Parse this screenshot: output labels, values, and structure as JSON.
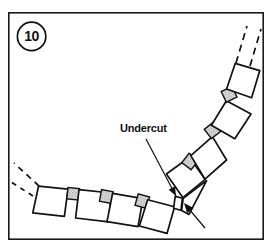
{
  "figure": {
    "number_label": "10",
    "frame": {
      "x": 8,
      "y": 12,
      "width": 256,
      "height": 228,
      "stroke_color": "#1a1a1a"
    },
    "background_color": "#ffffff",
    "line_color": "#111111"
  },
  "callouts": [
    {
      "id": "undercut",
      "label": "Undercut",
      "text_x": 120,
      "text_y": 132,
      "leader_from_x": 146,
      "leader_from_y": 139,
      "leader_to_x": 176,
      "leader_to_y": 196
    }
  ],
  "indicator_arrow": {
    "name": "undercut-arrow",
    "from_x": 205,
    "from_y": 228,
    "to_x": 184,
    "to_y": 203
  },
  "arch": {
    "description": "Segmented arch ring of voussoir blocks separated by small stippled shim blocks",
    "center_x": 58,
    "center_y": 60,
    "inner_radius": 118,
    "outer_radius": 148,
    "start_angle_deg": 14,
    "end_angle_deg": 78,
    "voussoir_count": 8,
    "shim_count": 7,
    "shim_fill_color": "#d8d8d8",
    "voussoir_fill_color": "#ffffff"
  },
  "break_lines": {
    "upper_right": [
      {
        "x1": 236,
        "y1": 63,
        "x2": 247,
        "y2": 26
      },
      {
        "x1": 250,
        "y1": 66,
        "x2": 261,
        "y2": 29
      }
    ],
    "lower_left": [
      {
        "x1": 39,
        "y1": 186,
        "x2": 14,
        "y2": 163
      },
      {
        "x1": 33,
        "y1": 196,
        "x2": 8,
        "y2": 180
      }
    ]
  }
}
